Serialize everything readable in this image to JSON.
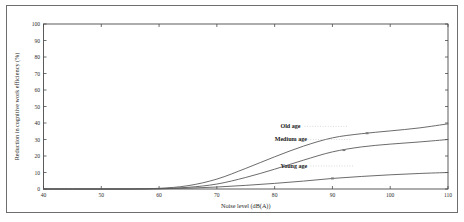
{
  "figure": {
    "background_color": "#ffffff",
    "frame_color": "#6e6e6e",
    "axis_color": "#4a4a4a",
    "curve_color": "#5a5a5a"
  },
  "chart_data": {
    "type": "line",
    "title": "",
    "xlabel": "Noise level (dB(A))",
    "ylabel": "Reduction in cognitive work efficiency (%)",
    "xlim": [
      40,
      110
    ],
    "ylim": [
      0,
      100
    ],
    "xticks": [
      40,
      50,
      60,
      70,
      80,
      90,
      100,
      110
    ],
    "yticks": [
      0,
      10,
      20,
      30,
      40,
      50,
      60,
      70,
      80,
      90,
      100
    ],
    "grid": false,
    "legend": "inline-labels",
    "x": [
      40,
      45,
      50,
      55,
      60,
      65,
      70,
      75,
      80,
      85,
      90,
      95,
      100,
      105,
      110
    ],
    "series": [
      {
        "name": "Old age",
        "label": "Old age",
        "label_x": 81,
        "label_y": 37,
        "values": [
          0,
          0,
          0,
          0,
          0.4,
          2.0,
          6.0,
          12.5,
          19.5,
          26.0,
          31.0,
          33.5,
          35.2,
          37.0,
          39.5
        ]
      },
      {
        "name": "Medium age",
        "label": "Medium age",
        "label_x": 80,
        "label_y": 29,
        "values": [
          0,
          0,
          0,
          0,
          0.2,
          1.0,
          3.0,
          7.0,
          12.0,
          17.5,
          22.5,
          25.5,
          27.2,
          28.5,
          30.0
        ]
      },
      {
        "name": "Young age",
        "label": "Young age",
        "label_x": 81,
        "label_y": 13,
        "values": [
          0,
          0,
          0,
          0,
          0.1,
          0.5,
          1.2,
          2.2,
          3.4,
          4.8,
          6.4,
          7.6,
          8.6,
          9.4,
          10.0
        ]
      }
    ],
    "markers": [
      {
        "series": "Old age",
        "x": 96,
        "y": 33.8
      },
      {
        "series": "Medium age",
        "x": 92,
        "y": 23.6
      },
      {
        "series": "Young age",
        "x": 90,
        "y": 6.4
      }
    ],
    "xtick_labels": [
      "40",
      "50",
      "60",
      "70",
      "80",
      "90",
      "100",
      "110"
    ],
    "ytick_labels": [
      "0",
      "10",
      "20",
      "30",
      "40",
      "50",
      "60",
      "70",
      "80",
      "90",
      "100"
    ]
  }
}
